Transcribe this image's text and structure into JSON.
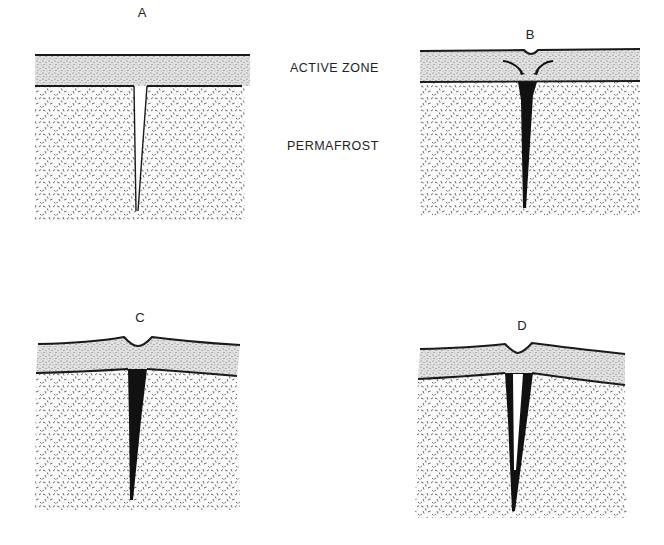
{
  "figure": {
    "legend": {
      "active_zone": "ACTIVE ZONE",
      "permafrost": "PERMAFROST"
    },
    "panels": [
      {
        "id": "A",
        "label": "A",
        "stage": "Open thermal contraction crack extending from active zone into permafrost"
      },
      {
        "id": "B",
        "label": "B",
        "stage": "Crack filled with ice (black wedge); active zone material slumps toward crack, slight surface depression"
      },
      {
        "id": "C",
        "label": "C",
        "stage": "Ice wedge widens; raised ridges flank central trough at surface"
      },
      {
        "id": "D",
        "label": "D",
        "stage": "Ice wedge with new open crack in its center; surface ridges and trough"
      }
    ],
    "colors": {
      "background": "#ffffff",
      "outline": "#1a1a1a",
      "active_zone_fill": "#d8d8d8",
      "permafrost_fill": "#f4f4f4",
      "ice_wedge": "#111111"
    }
  }
}
